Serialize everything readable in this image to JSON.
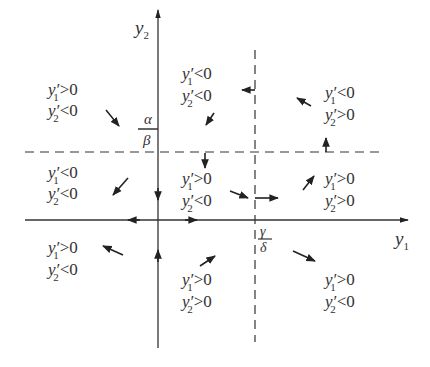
{
  "diagram": {
    "type": "phase-plane",
    "axes": {
      "x_label": "y",
      "x_label_sub": "1",
      "y_label": "y",
      "y_label_sub": "2"
    },
    "nullclines": {
      "horizontal": {
        "numerator": "α",
        "denominator": "β",
        "style": "dashed"
      },
      "vertical": {
        "numerator": "γ",
        "denominator": "δ",
        "style": "dashed"
      }
    },
    "regions": [
      {
        "id": "upper-left",
        "line1": {
          "var": "y′",
          "sub": "1",
          "rel": ">0"
        },
        "line2": {
          "var": "y′",
          "sub": "2",
          "rel": "<0"
        },
        "arrow": "down-right"
      },
      {
        "id": "upper-middle",
        "line1": {
          "var": "y′",
          "sub": "1",
          "rel": "<0"
        },
        "line2": {
          "var": "y′",
          "sub": "2",
          "rel": "<0"
        },
        "arrow": "down-left"
      },
      {
        "id": "upper-right",
        "line1": {
          "var": "y′",
          "sub": "1",
          "rel": "<0"
        },
        "line2": {
          "var": "y′",
          "sub": "2",
          "rel": ">0"
        },
        "arrow": "up-left"
      },
      {
        "id": "middle-left",
        "line1": {
          "var": "y′",
          "sub": "1",
          "rel": "<0"
        },
        "line2": {
          "var": "y′",
          "sub": "2",
          "rel": "<0"
        },
        "arrow": "down-left"
      },
      {
        "id": "middle-center",
        "line1": {
          "var": "y′",
          "sub": "1",
          "rel": ">0"
        },
        "line2": {
          "var": "y′",
          "sub": "2",
          "rel": "<0"
        },
        "arrow": "down-right"
      },
      {
        "id": "middle-right",
        "line1": {
          "var": "y′",
          "sub": "1",
          "rel": ">0"
        },
        "line2": {
          "var": "y′",
          "sub": "2",
          "rel": ">0"
        },
        "arrow": "up-right"
      },
      {
        "id": "lower-left",
        "line1": {
          "var": "y′",
          "sub": "1",
          "rel": ">0"
        },
        "line2": {
          "var": "y′",
          "sub": "2",
          "rel": "<0"
        },
        "arrow": "up-left"
      },
      {
        "id": "lower-middle",
        "line1": {
          "var": "y′",
          "sub": "1",
          "rel": ">0"
        },
        "line2": {
          "var": "y′",
          "sub": "2",
          "rel": ">0"
        },
        "arrow": "up-right"
      },
      {
        "id": "lower-right",
        "line1": {
          "var": "y′",
          "sub": "1",
          "rel": ">0"
        },
        "line2": {
          "var": "y′",
          "sub": "2",
          "rel": "<0"
        },
        "arrow": "down-right"
      }
    ],
    "colors": {
      "ink": "#333333",
      "background": "#ffffff"
    }
  }
}
